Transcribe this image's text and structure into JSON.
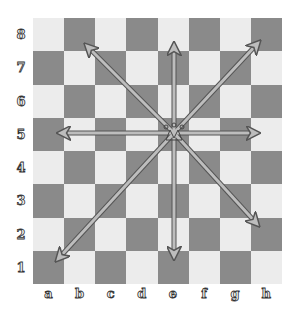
{
  "diagram": {
    "piece": {
      "type": "queen",
      "square": "e5"
    },
    "ranks": [
      "8",
      "7",
      "6",
      "5",
      "4",
      "3",
      "2",
      "1"
    ],
    "files": [
      "a",
      "b",
      "c",
      "d",
      "e",
      "f",
      "g",
      "h"
    ],
    "colors": {
      "light": "#ececec",
      "dark": "#8a8a8a",
      "arrow_fill": "#bdbdbd",
      "arrow_stroke": "#555555"
    },
    "arrows": [
      {
        "from": "e5",
        "to": "e8",
        "direction": "north"
      },
      {
        "from": "e5",
        "to": "h8",
        "direction": "north-east"
      },
      {
        "from": "e5",
        "to": "h5",
        "direction": "east"
      },
      {
        "from": "e5",
        "to": "h2",
        "direction": "south-east"
      },
      {
        "from": "e5",
        "to": "e1",
        "direction": "south"
      },
      {
        "from": "e5",
        "to": "a1",
        "direction": "south-west"
      },
      {
        "from": "e5",
        "to": "a5",
        "direction": "west"
      },
      {
        "from": "e5",
        "to": "b8",
        "direction": "north-west"
      }
    ]
  }
}
